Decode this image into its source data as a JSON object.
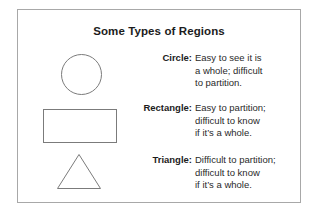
{
  "figure": {
    "title": "Some Types of Regions",
    "border_color": "#a8a8a8",
    "shape_stroke_color": "#7b7b7b",
    "text_color": "#1c1c1c",
    "background_color": "#ffffff",
    "rows": [
      {
        "shape": "circle",
        "label": "Circle:",
        "lines": [
          "Easy to see it is",
          "a whole; difficult",
          "to partition."
        ]
      },
      {
        "shape": "rectangle",
        "label": "Rectangle:",
        "lines": [
          "Easy to partition;",
          "difficult to know",
          "if it’s a whole."
        ]
      },
      {
        "shape": "triangle",
        "label": "Triangle:",
        "lines": [
          "Difficult to partition;",
          "difficult to know",
          "if it’s a whole."
        ]
      }
    ]
  }
}
